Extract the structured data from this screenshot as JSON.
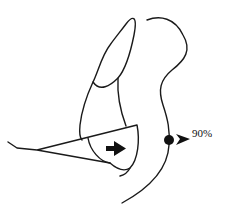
{
  "diagram": {
    "type": "anatomical line drawing",
    "stroke_color": "#1a1a1a",
    "background": "#ffffff",
    "elements": [
      {
        "name": "outer-contour",
        "description": "large curved outline on right side, ending in hook at top"
      },
      {
        "name": "inner-lobe",
        "description": "elongated oval lobe at top-left"
      },
      {
        "name": "wedge-flap",
        "description": "triangular wedge extending left with bent tail"
      },
      {
        "name": "direction-arrow",
        "description": "solid black arrow pointing right inside wedge"
      },
      {
        "name": "marker-dot",
        "description": "solid black dot on contour with chevron pointer"
      }
    ],
    "label": "90%"
  },
  "caption": {
    "text": "",
    "visible": "cut off at bottom edge (illegible)"
  }
}
